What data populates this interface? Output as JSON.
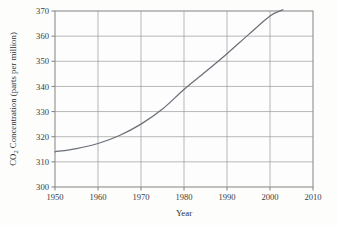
{
  "chart_data": {
    "type": "line",
    "title": "",
    "xlabel": "Year",
    "ylabel": "CO2 Concentration (parts per million)",
    "ylabel_prefix": "CO",
    "ylabel_subscript": "2",
    "ylabel_suffix": " Concentration (parts per million)",
    "xlim": [
      1950,
      2010
    ],
    "ylim": [
      300,
      370
    ],
    "grid": true,
    "legend": false,
    "legend_position": "none",
    "xticks": [
      1950,
      1960,
      1970,
      1980,
      1990,
      2000,
      2010
    ],
    "xtick_labels": [
      "1950",
      "1960",
      "1970",
      "1980",
      "1990",
      "2000",
      "2010"
    ],
    "yticks": [
      300,
      310,
      320,
      330,
      340,
      350,
      360,
      370
    ],
    "ytick_labels": [
      "300",
      "310",
      "320",
      "330",
      "340",
      "350",
      "360",
      "370"
    ],
    "series": [
      {
        "name": "Atmospheric CO2 concentration",
        "color": "#6a6f78",
        "x": [
          1950,
          1955,
          1960,
          1965,
          1970,
          1975,
          1980,
          1985,
          1990,
          1995,
          2000,
          2003
        ],
        "values": [
          314.0,
          315.3,
          317.3,
          320.5,
          325.0,
          331.0,
          338.8,
          345.8,
          353.0,
          360.6,
          368.0,
          370.5
        ]
      }
    ]
  },
  "figure": {
    "background_color": "#fdfdfc",
    "axis_color": "#8e8e90",
    "grid_color": "#9a9a9c",
    "text_color": "#3c3c3e"
  }
}
